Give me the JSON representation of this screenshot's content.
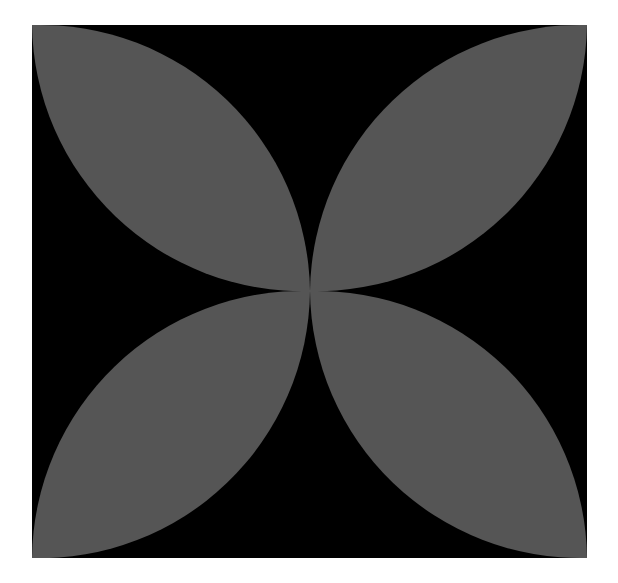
{
  "figure": {
    "background_color": "#000000",
    "petal_color": "#555555",
    "page_color": "#ffffff",
    "square": {
      "x": 32,
      "y": 25,
      "width": 555,
      "height": 533
    },
    "center": {
      "x": 310,
      "y": 291
    },
    "petal_arc_radius": 270,
    "petals": [
      {
        "name": "top-left",
        "corner": [
          32,
          25
        ]
      },
      {
        "name": "top-right",
        "corner": [
          587,
          25
        ]
      },
      {
        "name": "bottom-left",
        "corner": [
          32,
          558
        ]
      },
      {
        "name": "bottom-right",
        "corner": [
          587,
          558
        ]
      }
    ]
  }
}
